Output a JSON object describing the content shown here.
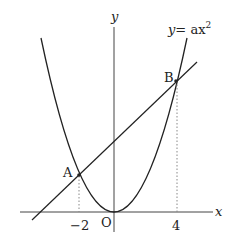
{
  "diagram": {
    "curve_label_lhs": "y",
    "curve_label_eq": "= ax",
    "curve_label_exp": "2",
    "axis_x_label": "x",
    "axis_y_label": "y",
    "origin_label": "O",
    "point_a_label": "A",
    "point_b_label": "B",
    "tick_neg2": "−2",
    "tick_4": "4",
    "colors": {
      "stroke": "#222222",
      "dotted": "#888888"
    }
  }
}
